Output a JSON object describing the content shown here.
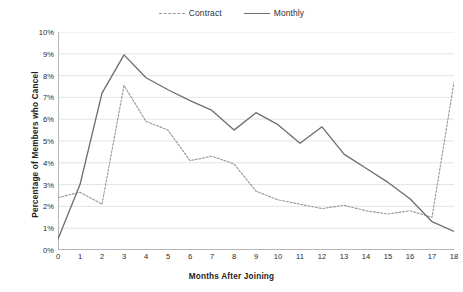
{
  "chart_data": {
    "type": "line",
    "title": "",
    "xlabel": "Months After Joining",
    "ylabel": "Percentage of Members who Cancel",
    "x": [
      0,
      1,
      2,
      3,
      4,
      5,
      6,
      7,
      8,
      9,
      10,
      11,
      12,
      13,
      14,
      15,
      16,
      17,
      18
    ],
    "xtick_labels": [
      "0",
      "1",
      "2",
      "3",
      "4",
      "5",
      "6",
      "7",
      "8",
      "9",
      "10",
      "11",
      "12",
      "13",
      "14",
      "15",
      "16",
      "17",
      "18"
    ],
    "ytick_labels": [
      "0%",
      "1%",
      "2%",
      "3%",
      "4%",
      "5%",
      "6%",
      "7%",
      "8%",
      "9%",
      "10%"
    ],
    "ytick_values": [
      0,
      1,
      2,
      3,
      4,
      5,
      6,
      7,
      8,
      9,
      10
    ],
    "xlim": [
      0,
      18
    ],
    "ylim": [
      0,
      10
    ],
    "grid": "horizontal",
    "legend_position": "top-center",
    "series": [
      {
        "name": "Contract",
        "style": "dashed",
        "color": "#9b9b9b",
        "values": [
          2.4,
          2.65,
          2.1,
          7.55,
          5.9,
          5.5,
          4.1,
          4.3,
          3.95,
          2.7,
          2.3,
          2.1,
          1.9,
          2.05,
          1.8,
          1.65,
          1.8,
          1.5,
          7.7
        ]
      },
      {
        "name": "Monthly",
        "style": "solid",
        "color": "#6f6f6f",
        "values": [
          0.5,
          3.0,
          7.2,
          8.95,
          7.9,
          7.35,
          6.85,
          6.4,
          5.5,
          6.3,
          5.75,
          4.9,
          5.65,
          4.4,
          3.75,
          3.1,
          2.35,
          1.3,
          0.85
        ]
      }
    ]
  },
  "legend": {
    "entries": [
      {
        "label": "Contract",
        "style": "dashed"
      },
      {
        "label": "Monthly",
        "style": "solid"
      }
    ]
  },
  "colors": {
    "background": "#ffffff",
    "grid": "#d9d9d9",
    "axis": "#b0b0b0",
    "text": "#222222",
    "contract": "#9b9b9b",
    "monthly": "#6f6f6f"
  }
}
